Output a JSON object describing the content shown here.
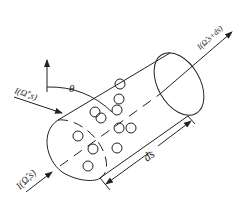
{
  "diagram": {
    "type": "radiative-transfer-cylinder",
    "labels": {
      "incident_intensity": "I(Ω̂',s)",
      "intensity_in": "I(Ω̂,s)",
      "intensity_out": "I(Ω̂,s+ds)",
      "angle": "θ",
      "path_length": "ds"
    },
    "colors": {
      "stroke": "#222222",
      "background": "#ffffff"
    },
    "particles_count": 11
  }
}
